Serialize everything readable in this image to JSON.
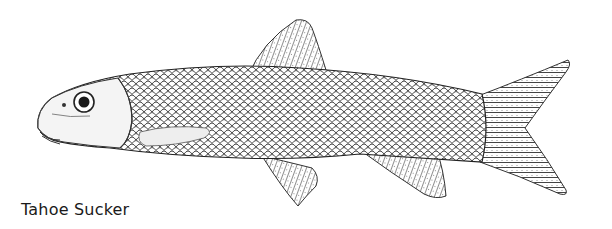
{
  "figure": {
    "caption": "Tahoe Sucker",
    "style": "black-and-white scientific line drawing",
    "colors": {
      "ink": "#1a1a1a",
      "background": "#ffffff"
    }
  }
}
